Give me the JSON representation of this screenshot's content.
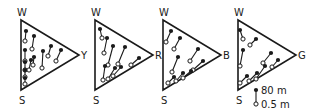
{
  "diagram": {
    "type": "ternary-triangles",
    "panels": [
      {
        "id": "wsy",
        "vertices": {
          "top": "W",
          "bottom": "S",
          "right": "Y"
        },
        "origin_x": 21,
        "segments": [
          [
            26,
            31,
            25,
            41
          ],
          [
            34,
            36,
            32,
            49
          ],
          [
            25,
            50,
            25,
            61
          ],
          [
            25,
            62,
            25,
            70
          ],
          [
            25,
            70,
            25,
            77
          ],
          [
            25,
            78,
            25,
            84
          ],
          [
            31,
            60,
            29,
            70
          ],
          [
            34,
            57,
            33,
            65
          ],
          [
            43,
            51,
            42,
            68
          ],
          [
            51,
            46,
            48,
            56
          ],
          [
            61,
            50,
            56,
            61
          ]
        ]
      },
      {
        "id": "wsr",
        "vertices": {
          "top": "W",
          "bottom": "S",
          "right": "R"
        },
        "origin_x": 95,
        "segments": [
          [
            100,
            29,
            102,
            38
          ],
          [
            107,
            38,
            104,
            53
          ],
          [
            113,
            46,
            108,
            65
          ],
          [
            125,
            47,
            118,
            64
          ],
          [
            139,
            58,
            131,
            65
          ],
          [
            105,
            66,
            103,
            80
          ],
          [
            115,
            68,
            108,
            79
          ],
          [
            121,
            67,
            113,
            76
          ]
        ]
      },
      {
        "id": "wsb",
        "vertices": {
          "top": "W",
          "bottom": "S",
          "right": "B"
        },
        "origin_x": 163,
        "segments": [
          [
            171,
            31,
            166,
            42
          ],
          [
            180,
            38,
            174,
            49
          ],
          [
            178,
            57,
            172,
            72
          ],
          [
            198,
            49,
            190,
            61
          ],
          [
            203,
            61,
            193,
            70
          ],
          [
            174,
            77,
            168,
            83
          ],
          [
            183,
            73,
            176,
            81
          ],
          [
            191,
            71,
            183,
            78
          ]
        ]
      },
      {
        "id": "wsg",
        "vertices": {
          "top": "W",
          "bottom": "S",
          "right": "G"
        },
        "origin_x": 238,
        "segments": [
          [
            240,
            30,
            243,
            39
          ],
          [
            256,
            39,
            250,
            45
          ],
          [
            243,
            50,
            240,
            66
          ],
          [
            271,
            53,
            263,
            63
          ],
          [
            278,
            60,
            272,
            67
          ],
          [
            247,
            76,
            240,
            83
          ],
          [
            257,
            73,
            249,
            81
          ],
          [
            265,
            66,
            256,
            79
          ]
        ]
      }
    ],
    "legend": {
      "top_marker": "filled",
      "top_label": "80 m",
      "bottom_marker": "open",
      "bottom_label": "0.5 m"
    }
  }
}
